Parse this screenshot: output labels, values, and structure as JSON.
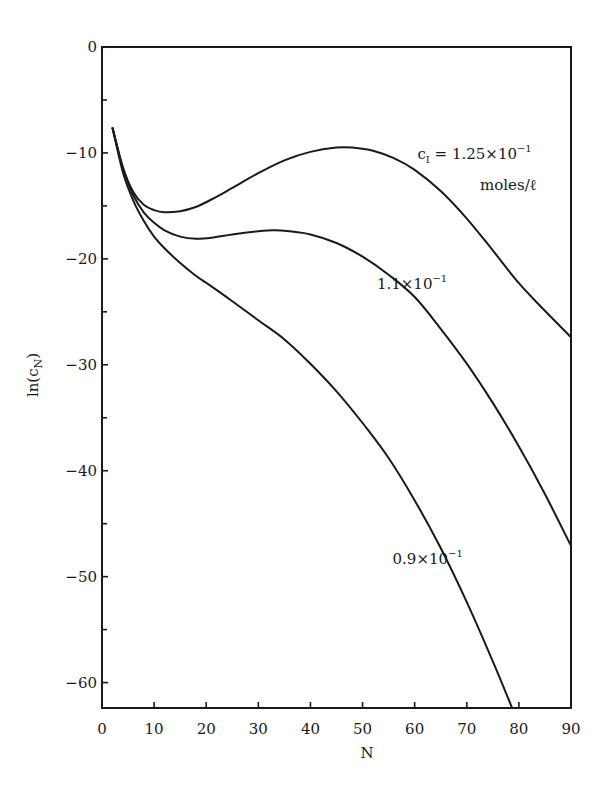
{
  "chart_data": {
    "type": "line",
    "title": "",
    "xlabel": "N",
    "ylabel": "ln(c_N)",
    "xlim": [
      0,
      90
    ],
    "ylim": [
      -62.4,
      0
    ],
    "grid": false,
    "legend": "inline annotations",
    "x_ticks": [
      0,
      10,
      20,
      30,
      40,
      50,
      60,
      70,
      80,
      90
    ],
    "y_ticks": [
      0,
      -10,
      -20,
      -30,
      -40,
      -50,
      -60
    ],
    "y_minor_ticks": [
      -5,
      -15,
      -25,
      -35,
      -45,
      -55
    ],
    "series": [
      {
        "name": "c_I = 1.25×10^-1 moles/ℓ",
        "x": [
          2,
          4,
          6,
          8,
          10,
          12,
          15,
          18,
          21,
          25,
          30,
          35,
          40,
          45,
          48,
          52,
          56,
          60,
          65,
          70,
          75,
          80,
          85,
          90
        ],
        "values": [
          -7.6,
          -11.3,
          -13.7,
          -14.9,
          -15.4,
          -15.6,
          -15.5,
          -15.1,
          -14.4,
          -13.3,
          -11.9,
          -10.7,
          -9.9,
          -9.5,
          -9.5,
          -9.8,
          -10.5,
          -11.6,
          -13.6,
          -16.2,
          -19.2,
          -22.3,
          -24.9,
          -27.4
        ]
      },
      {
        "name": "1.1×10^-1",
        "x": [
          2,
          4,
          6,
          8,
          10,
          12,
          15,
          18,
          21,
          25,
          30,
          33,
          36,
          40,
          45,
          50,
          55,
          60,
          65,
          70,
          75,
          80,
          85,
          90
        ],
        "values": [
          -7.6,
          -11.5,
          -14.0,
          -15.6,
          -16.6,
          -17.3,
          -17.9,
          -18.1,
          -18.0,
          -17.7,
          -17.4,
          -17.3,
          -17.4,
          -17.7,
          -18.5,
          -19.8,
          -21.5,
          -23.6,
          -26.6,
          -29.9,
          -33.6,
          -37.7,
          -42.2,
          -47.1
        ]
      },
      {
        "name": "0.9×10^-1",
        "x": [
          2,
          4,
          6,
          8,
          10,
          12,
          15,
          18,
          21,
          25,
          30,
          35,
          40,
          45,
          50,
          55,
          60,
          65,
          70,
          75,
          78.7
        ],
        "values": [
          -7.6,
          -11.8,
          -14.5,
          -16.4,
          -17.9,
          -19.0,
          -20.4,
          -21.6,
          -22.6,
          -24.0,
          -25.8,
          -27.6,
          -29.9,
          -32.5,
          -35.5,
          -38.8,
          -42.8,
          -47.3,
          -52.4,
          -58.0,
          -62.4
        ]
      }
    ],
    "annotations": [
      {
        "text_main": "c",
        "text_sub": "I",
        "text_rest": " = 1.25×10",
        "text_sup": "−1",
        "N": 71.5,
        "v": -10.6
      },
      {
        "text": "moles/ℓ",
        "N": 78,
        "v": -13.5
      },
      {
        "text_main": "1.1×10",
        "text_sup": "−1",
        "N": 59.5,
        "v": -22.8
      },
      {
        "text_main": "0.9×10",
        "text_sup": "−1",
        "N": 62.5,
        "v": -48.8
      }
    ]
  },
  "labels": {
    "ylabel_main": "ln(c",
    "ylabel_sub": "N",
    "ylabel_close": ")",
    "xlabel": "N"
  }
}
